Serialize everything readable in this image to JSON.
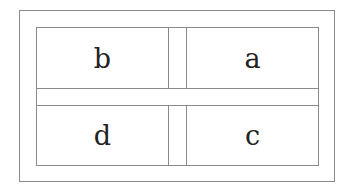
{
  "diagram": {
    "cells": [
      {
        "position": "top-left",
        "label": "b"
      },
      {
        "position": "top-right",
        "label": "a"
      },
      {
        "position": "bottom-left",
        "label": "d"
      },
      {
        "position": "bottom-right",
        "label": "c"
      }
    ],
    "colors": {
      "border": "#8a8a8a",
      "text": "#222222",
      "background": "#ffffff"
    }
  }
}
